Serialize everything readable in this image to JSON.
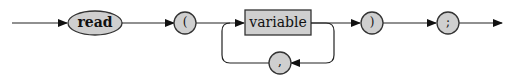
{
  "diagram": {
    "type": "syntax-diagram",
    "statement": "read",
    "colors": {
      "node_fill": "#cfcfcf",
      "node_stroke": "#333333",
      "line": "#222222"
    },
    "nodes": [
      {
        "id": "read",
        "shape": "ellipse",
        "label": "read"
      },
      {
        "id": "lparen",
        "shape": "circle",
        "label": "("
      },
      {
        "id": "variable",
        "shape": "rectangle",
        "label": "variable"
      },
      {
        "id": "comma",
        "shape": "circle",
        "label": ","
      },
      {
        "id": "rparen",
        "shape": "circle",
        "label": ")"
      },
      {
        "id": "semicolon",
        "shape": "circle",
        "label": ";"
      }
    ],
    "edges": [
      {
        "from": "start",
        "to": "read"
      },
      {
        "from": "read",
        "to": "lparen"
      },
      {
        "from": "lparen",
        "to": "variable"
      },
      {
        "from": "variable",
        "to": "rparen"
      },
      {
        "from": "variable",
        "to": "comma",
        "note": "loop back"
      },
      {
        "from": "comma",
        "to": "variable"
      },
      {
        "from": "rparen",
        "to": "semicolon"
      },
      {
        "from": "semicolon",
        "to": "end"
      }
    ]
  }
}
